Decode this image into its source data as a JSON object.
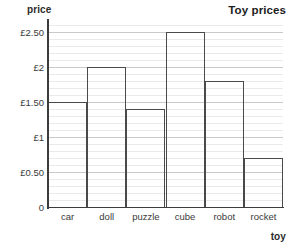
{
  "chart_data": {
    "type": "bar",
    "title": "Toy prices",
    "xlabel": "toy",
    "ylabel": "price",
    "categories": [
      "car",
      "doll",
      "puzzle",
      "cube",
      "robot",
      "rocket"
    ],
    "values": [
      1.5,
      2.0,
      1.4,
      2.5,
      1.8,
      0.7
    ],
    "value_labels": [
      "£1.50",
      "£2",
      "£1.40",
      "£2.50",
      "£1.80",
      "£0.70"
    ],
    "ylim": [
      0,
      2.65
    ],
    "ytick_values": [
      0,
      0.5,
      1,
      1.5,
      2,
      2.5
    ],
    "ytick_labels": [
      "0",
      "£0.50",
      "£1",
      "£1.50",
      "£2",
      "£2.50"
    ],
    "minor_tick_step": 0.1,
    "grid": "horizontal-major-and-minor",
    "legend": "none",
    "bar_style": "outline",
    "currency": "GBP",
    "colors": {
      "bar_outline": "#4a4a4a",
      "bar_fill": "#ffffff",
      "axis": "#3c3c3c",
      "gridline_major": "#c9c9c9",
      "gridline_minor": "#eaeaea",
      "text": "#3a3a3a",
      "title": "#1d1d1d",
      "background": "#ffffff"
    }
  }
}
